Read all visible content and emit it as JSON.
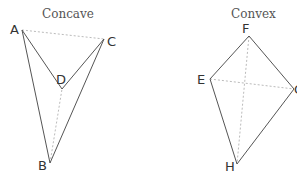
{
  "diagram": {
    "concave": {
      "title": "Concave",
      "vertices": {
        "A": {
          "label": "A",
          "x": 22,
          "y": 30
        },
        "B": {
          "label": "B",
          "x": 50,
          "y": 163
        },
        "C": {
          "label": "C",
          "x": 104,
          "y": 39
        },
        "D": {
          "label": "D",
          "x": 62,
          "y": 89
        }
      },
      "edges": [
        [
          "A",
          "B"
        ],
        [
          "B",
          "C"
        ],
        [
          "C",
          "D"
        ],
        [
          "D",
          "A"
        ]
      ],
      "diagonals": [
        [
          "A",
          "C"
        ],
        [
          "B",
          "D"
        ]
      ]
    },
    "convex": {
      "title": "Convex",
      "vertices": {
        "E": {
          "label": "E",
          "x": 210,
          "y": 79
        },
        "F": {
          "label": "F",
          "x": 249,
          "y": 36
        },
        "G": {
          "label": "G",
          "x": 294,
          "y": 89
        },
        "H": {
          "label": "H",
          "x": 237,
          "y": 164
        }
      },
      "edges": [
        [
          "E",
          "F"
        ],
        [
          "F",
          "G"
        ],
        [
          "G",
          "H"
        ],
        [
          "H",
          "E"
        ]
      ],
      "diagonals": [
        [
          "E",
          "G"
        ],
        [
          "F",
          "H"
        ]
      ]
    }
  }
}
